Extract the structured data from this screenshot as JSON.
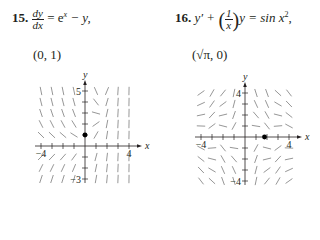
{
  "problems": [
    {
      "number": "15.",
      "equation": {
        "lhs_num": "dy",
        "lhs_den": "dx",
        "rhs": "= e",
        "rhs_sup": "x",
        "rhs_tail": " − y,"
      },
      "point": "(0, 1)",
      "plot": {
        "origin": [
          85,
          146
        ],
        "unit": 11,
        "x_range": [
          -4,
          4
        ],
        "y_range": [
          -3,
          5
        ],
        "axis_labels": {
          "x": "x",
          "y": "y"
        },
        "tick_labels": [
          {
            "text": "5",
            "x": 0,
            "y": 5,
            "side": "left"
          },
          {
            "text": "−4",
            "x": -4,
            "y": 0,
            "side": "below"
          },
          {
            "text": "4",
            "x": 4,
            "y": 0,
            "side": "below"
          },
          {
            "text": "−3",
            "x": 0,
            "y": -3,
            "side": "left"
          }
        ],
        "field": "exp_x_minus_y",
        "marked_point": [
          0,
          1
        ]
      }
    },
    {
      "number": "16.",
      "equation": {
        "lhs": "y′ + ",
        "frac_num": "1",
        "frac_den": "x",
        "rhs": "y = sin x",
        "rhs_sup": "2",
        "tail": ","
      },
      "point": "(√π, 0)",
      "plot": {
        "origin": [
          245,
          137
        ],
        "unit": 11,
        "x_range": [
          -4,
          4
        ],
        "y_range": [
          -4,
          4
        ],
        "axis_labels": {
          "x": "x",
          "y": "y"
        },
        "tick_labels": [
          {
            "text": "4",
            "x": 0,
            "y": 4,
            "side": "left"
          },
          {
            "text": "−4",
            "x": -4,
            "y": 0,
            "side": "below"
          },
          {
            "text": "4",
            "x": 4,
            "y": 0,
            "side": "below"
          },
          {
            "text": "−4",
            "x": 0,
            "y": -4,
            "side": "left"
          }
        ],
        "field": "sinx2_minus_y_over_x",
        "marked_point": [
          1.7725,
          0
        ]
      }
    }
  ]
}
